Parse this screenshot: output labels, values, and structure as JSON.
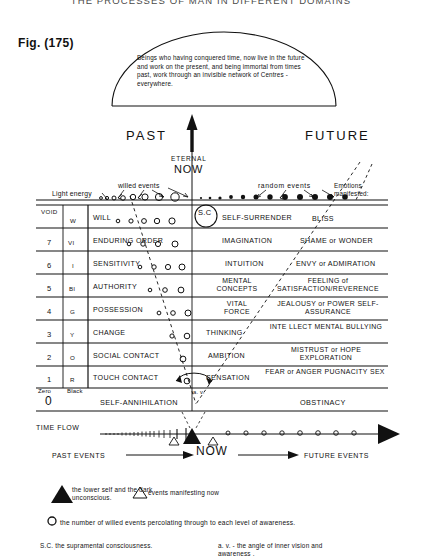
{
  "page": {
    "title_top": "THE PROCESSES OF MAN IN DIFFERENT DOMAINS",
    "figure_label": "Fig. (175)"
  },
  "dome": {
    "text": "Beings who having conquered time, now live in the future and work on the present, and being immortal from times past, work through an invisible network of Centres - everywhere."
  },
  "axis": {
    "past": "PAST",
    "future": "FUTURE",
    "eternal": "ETERNAL",
    "now": "NOW"
  },
  "top_band": {
    "light_energy": "Light energy",
    "willed_events": "willed events",
    "random_events": "random  events",
    "emotions_line1": "Emotions",
    "emotions_line2": "manifested:"
  },
  "sc": {
    "label": "S.C"
  },
  "table": {
    "rows": [
      {
        "num": "",
        "color": "W",
        "void": "VOID",
        "left": "WILL",
        "mid": "SELF-SURRENDER",
        "right": "BLISS",
        "circles": 6
      },
      {
        "num": "7",
        "color": "VI",
        "void": "",
        "left": "ENDURING ORDER",
        "mid": "IMAGINATION",
        "right": "SHAME or WONDER",
        "circles": 5
      },
      {
        "num": "6",
        "color": "I",
        "void": "",
        "left": "SENSITIVITY",
        "mid": "INTUITION",
        "right": "ENVY  or  ADMIRATION",
        "circles": 5
      },
      {
        "num": "5",
        "color": "Bl",
        "void": "",
        "left": "AUTHORITY",
        "mid": "MENTAL\nCONCEPTS",
        "right": "FEELING of\nSATISFACTION/REVERENCE",
        "circles": 4
      },
      {
        "num": "4",
        "color": "G",
        "void": "",
        "left": "POSSESSION",
        "mid": "VITAL\nFORCE",
        "right": "JEALOUSY or  POWER\nSELF-ASSURANCE",
        "circles": 3
      },
      {
        "num": "3",
        "color": "Y",
        "void": "",
        "left": "CHANGE",
        "mid": "THINKING",
        "right": "INTE LLECT\nMENTAL BULLYING",
        "circles": 2
      },
      {
        "num": "2",
        "color": "O",
        "void": "",
        "left": "SOCIAL CONTACT",
        "mid": "AMBITION",
        "right": "MISTRUST  or  HOPE\nEXPLORATION",
        "circles": 2
      },
      {
        "num": "1",
        "color": "R",
        "void": "",
        "left": "TOUCH CONTACT",
        "mid": "SENSATION",
        "right": "FEAR or ANGER\nPUGNACITY       SEX",
        "circles": 1
      }
    ],
    "zero_row": {
      "zero_word": "Zero",
      "black_word": "Black",
      "zero_num": "0",
      "left": "SELF-ANNIHILATION",
      "right": "OBSTINACY"
    }
  },
  "angle": {
    "label": "a. v."
  },
  "timeline": {
    "time_flow": "TIME FLOW",
    "past_events": "PAST EVENTS",
    "now": "NOW",
    "future_events": "FUTURE EVENTS"
  },
  "legend": {
    "filled_triangle": "the lower self and\nthe dark unconscious.",
    "open_triangle": "events manifesting now",
    "circle": "the number of willed events percolating through to each level of awareness.",
    "sc": "S.C. the supramental consciousness.",
    "av": "a. v. - the angle of inner vision\nand awareness ."
  },
  "colors": {
    "ink": "#111111",
    "paper": "#ffffff",
    "faint": "#4a4a4a"
  }
}
